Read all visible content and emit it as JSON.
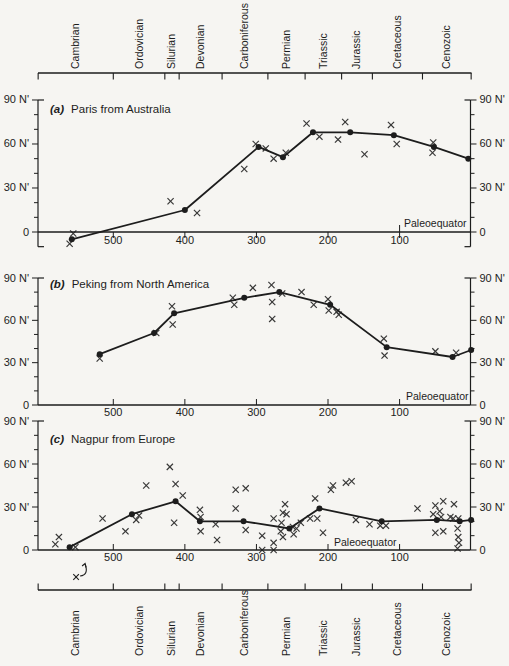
{
  "figure": {
    "background_color": "#f6f5f2",
    "ink_color": "#1d1d1d"
  },
  "chart_data": {
    "type": "line",
    "x_domain_ma": [
      605,
      0
    ],
    "x_tick_values": [
      500,
      400,
      300,
      200,
      100
    ],
    "x_tick_labels": [
      "500",
      "400",
      "300",
      "200",
      "100"
    ],
    "y_tick_values": [
      0,
      30,
      60,
      90
    ],
    "y_tick_labels": [
      "0",
      "30 N'",
      "60 N'",
      "90 N'"
    ],
    "geologic_periods": {
      "names": [
        "Cambrian",
        "Ordovician",
        "Silurian",
        "Devonian",
        "Carboniferous",
        "Permian",
        "Triassic",
        "Jurassic",
        "Cretaceous",
        "Cenozoic"
      ],
      "boundaries_ma": [
        605,
        500,
        428,
        408,
        348,
        284,
        232,
        181,
        138,
        68,
        0
      ]
    },
    "panels": [
      {
        "label": "(a)",
        "title": "Paris from Australia",
        "paleoequator_label": "Paleoequator",
        "ylim": [
          -10,
          90
        ],
        "line_points_ma_lat": [
          [
            558,
            -5
          ],
          [
            400,
            15
          ],
          [
            297,
            58
          ],
          [
            263,
            51
          ],
          [
            221,
            68
          ],
          [
            169,
            68
          ],
          [
            108,
            66
          ],
          [
            52,
            58
          ],
          [
            4,
            50
          ]
        ],
        "scatter_points_ma_lat": [
          [
            556,
            -1
          ],
          [
            561,
            -8
          ],
          [
            420,
            21
          ],
          [
            383,
            13
          ],
          [
            317,
            43
          ],
          [
            301,
            60
          ],
          [
            287,
            57
          ],
          [
            276,
            50
          ],
          [
            259,
            54
          ],
          [
            230,
            74
          ],
          [
            212,
            65
          ],
          [
            186,
            63
          ],
          [
            176,
            75
          ],
          [
            149,
            53
          ],
          [
            112,
            73
          ],
          [
            104,
            60
          ],
          [
            53,
            61
          ],
          [
            54,
            54
          ]
        ]
      },
      {
        "label": "(b)",
        "title": "Peking from North America",
        "paleoequator_label": "Paleoequator",
        "ylim": [
          0,
          90
        ],
        "line_points_ma_lat": [
          [
            519,
            36
          ],
          [
            443,
            51
          ],
          [
            415,
            65
          ],
          [
            317,
            76
          ],
          [
            268,
            80
          ],
          [
            197,
            71
          ],
          [
            118,
            41
          ],
          [
            26,
            34
          ],
          [
            0,
            39
          ]
        ],
        "scatter_points_ma_lat": [
          [
            519,
            33
          ],
          [
            440,
            51
          ],
          [
            418,
            70
          ],
          [
            417,
            57
          ],
          [
            333,
            76
          ],
          [
            331,
            71
          ],
          [
            305,
            83
          ],
          [
            279,
            85
          ],
          [
            278,
            73
          ],
          [
            278,
            61
          ],
          [
            264,
            79
          ],
          [
            237,
            80
          ],
          [
            220,
            71
          ],
          [
            200,
            75
          ],
          [
            199,
            67
          ],
          [
            188,
            66
          ],
          [
            185,
            64
          ],
          [
            122,
            47
          ],
          [
            121,
            35
          ],
          [
            50,
            38
          ],
          [
            21,
            37
          ]
        ]
      },
      {
        "label": "(c)",
        "title": "Nagpur from Europe",
        "paleoequator_label": "Paleoequator",
        "ylim": [
          0,
          90
        ],
        "line_points_ma_lat": [
          [
            561,
            2
          ],
          [
            474,
            25
          ],
          [
            413,
            34
          ],
          [
            379,
            20
          ],
          [
            318,
            20
          ],
          [
            254,
            15
          ],
          [
            212,
            29
          ],
          [
            125,
            20
          ],
          [
            48,
            21
          ],
          [
            16,
            20
          ],
          [
            0,
            21
          ]
        ],
        "scatter_points_ma_lat": [
          [
            581,
            4
          ],
          [
            576,
            9
          ],
          [
            553,
            2
          ],
          [
            515,
            22
          ],
          [
            483,
            13
          ],
          [
            468,
            21
          ],
          [
            464,
            24
          ],
          [
            454,
            45
          ],
          [
            421,
            58
          ],
          [
            413,
            46
          ],
          [
            403,
            38
          ],
          [
            415,
            19
          ],
          [
            379,
            28
          ],
          [
            378,
            23
          ],
          [
            378,
            13
          ],
          [
            357,
            18
          ],
          [
            355,
            7
          ],
          [
            329,
            42
          ],
          [
            315,
            43
          ],
          [
            329,
            29
          ],
          [
            315,
            14
          ],
          [
            292,
            10
          ],
          [
            292,
            0
          ],
          [
            276,
            22
          ],
          [
            276,
            5
          ],
          [
            276,
            0
          ],
          [
            260,
            32
          ],
          [
            263,
            26
          ],
          [
            258,
            25
          ],
          [
            265,
            19
          ],
          [
            266,
            13
          ],
          [
            263,
            9
          ],
          [
            249,
            16
          ],
          [
            244,
            15
          ],
          [
            248,
            11
          ],
          [
            238,
            19
          ],
          [
            225,
            22
          ],
          [
            218,
            36
          ],
          [
            215,
            22
          ],
          [
            207,
            12
          ],
          [
            196,
            42
          ],
          [
            193,
            45
          ],
          [
            175,
            47
          ],
          [
            167,
            48
          ],
          [
            161,
            21
          ],
          [
            142,
            18
          ],
          [
            127,
            17
          ],
          [
            119,
            17
          ],
          [
            75,
            29
          ],
          [
            50,
            31
          ],
          [
            53,
            25
          ],
          [
            50,
            12
          ],
          [
            44,
            27
          ],
          [
            42,
            23
          ],
          [
            39,
            34
          ],
          [
            39,
            13
          ],
          [
            29,
            23
          ],
          [
            25,
            22
          ],
          [
            24,
            32
          ],
          [
            19,
            15
          ],
          [
            18,
            22
          ],
          [
            18,
            9
          ],
          [
            17,
            5
          ],
          [
            19,
            1
          ]
        ],
        "offscale_marker": {
          "symbol": "x",
          "time_ma": 552,
          "has_arrow": true
        }
      }
    ]
  }
}
